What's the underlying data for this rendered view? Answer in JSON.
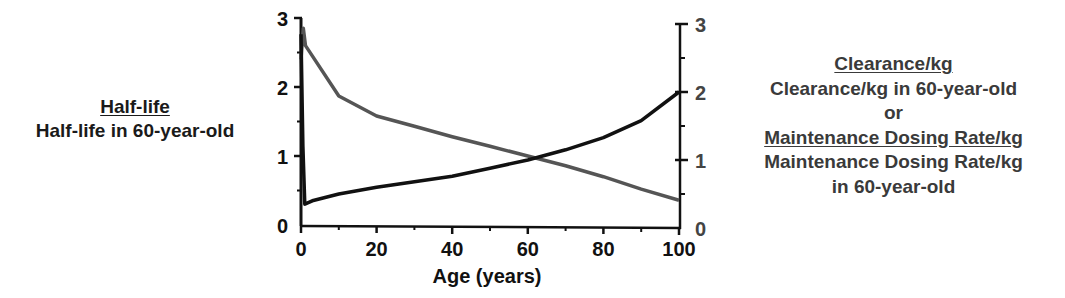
{
  "left_annotation": {
    "title": "Half-life",
    "subtitle": "Half-life in 60-year-old"
  },
  "right_annotation": {
    "line1": "Clearance/kg",
    "line2": "Clearance/kg in 60-year-old",
    "line3": "or",
    "line4": "Maintenance Dosing Rate/kg",
    "line5": "Maintenance Dosing Rate/kg",
    "line6": "in 60-year-old"
  },
  "axes": {
    "x_title": "Age (years)",
    "x_ticks": [
      "0",
      "20",
      "40",
      "60",
      "80",
      "100"
    ],
    "y_left_ticks": [
      "0",
      "1",
      "2",
      "3"
    ],
    "y_right_ticks": [
      "0",
      "1",
      "2",
      "3"
    ]
  },
  "colors": {
    "half_life": "#555555",
    "clearance": "#111111",
    "right_text": "#3a3a3a"
  },
  "chart_data": {
    "type": "line",
    "title": "",
    "xlabel": "Age (years)",
    "ylabel_left": "Half-life / Half-life in 60-year-old",
    "ylabel_right": "Clearance/kg / Clearance/kg in 60-year-old (or Maintenance Dosing Rate/kg ratio)",
    "xlim": [
      0,
      100
    ],
    "ylim": [
      0,
      3
    ],
    "x_ticks": [
      0,
      20,
      40,
      60,
      80,
      100
    ],
    "y_ticks": [
      0,
      1,
      2,
      3
    ],
    "grid": false,
    "legend": "none (series identified by side annotations; gray = left axis, black = right axis)",
    "series": [
      {
        "name": "Half-life ratio (relative to 60-year-old)",
        "axis": "left",
        "color": "#555555",
        "x": [
          0,
          0.6,
          1.2,
          3,
          10,
          20,
          30,
          40,
          50,
          60,
          70,
          80,
          90,
          100
        ],
        "values": [
          2.4,
          2.85,
          2.6,
          2.45,
          1.87,
          1.58,
          1.43,
          1.28,
          1.14,
          1.0,
          0.86,
          0.7,
          0.52,
          0.36
        ]
      },
      {
        "name": "Clearance/kg ratio (relative to 60-year-old)",
        "axis": "right",
        "color": "#111111",
        "x": [
          0,
          0.5,
          1,
          3,
          10,
          20,
          30,
          40,
          50,
          60,
          70,
          80,
          90,
          100
        ],
        "values": [
          2.85,
          1.2,
          0.35,
          0.4,
          0.5,
          0.6,
          0.68,
          0.76,
          0.88,
          1.0,
          1.15,
          1.33,
          1.58,
          2.0
        ]
      }
    ]
  }
}
